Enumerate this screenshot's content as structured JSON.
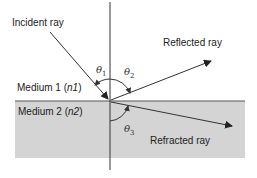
{
  "diagram": {
    "type": "optics-reflection-refraction",
    "labels": {
      "incident": "Incident ray",
      "reflected": "Reflected ray",
      "refracted": "Refracted ray",
      "medium1_prefix": "Medium 1 (",
      "medium1_n": "n1",
      "medium1_suffix": ")",
      "medium2_prefix": "Medium 2 (",
      "medium2_n": "n2",
      "medium2_suffix": ")"
    },
    "angles": {
      "theta1": {
        "symbol": "θ",
        "sub": "1"
      },
      "theta2": {
        "symbol": "θ",
        "sub": "2"
      },
      "theta3": {
        "symbol": "θ",
        "sub": "3"
      }
    },
    "colors": {
      "medium2_fill": "#d4d4d4",
      "line": "#333333",
      "interface": "#555555"
    }
  }
}
